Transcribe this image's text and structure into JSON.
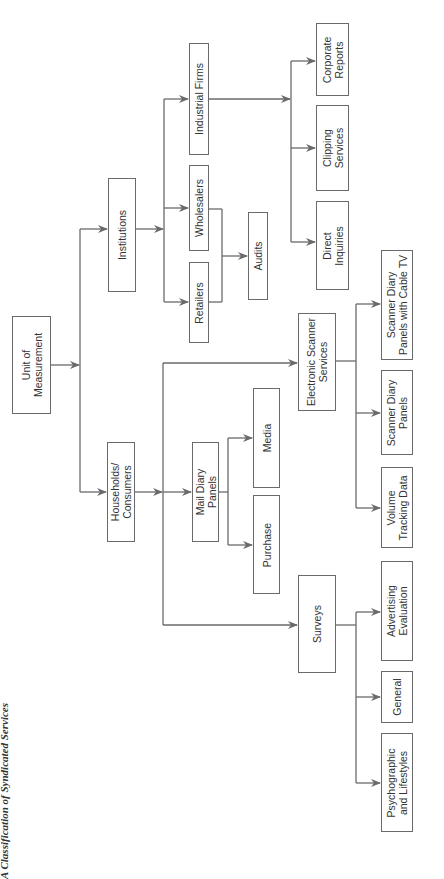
{
  "caption": "A Classification of Syndicated Services",
  "colors": {
    "line": "#6a6a6a",
    "text": "#333333",
    "background": "#ffffff"
  },
  "nodes": {
    "root": "Unit of\nMeasurement",
    "households": "Households/\nConsumers",
    "institutions": "Institutions",
    "retailers": "Retailers",
    "wholesalers": "Wholesalers",
    "industrial": "Industrial Firms",
    "audits": "Audits",
    "direct": "Direct\nInquiries",
    "clipping": "Clipping\nServices",
    "corporate": "Corporate\nReports",
    "mail_diary": "Mail Diary\nPanels",
    "media": "Media",
    "purchase": "Purchase",
    "electronic": "Electronic Scanner\nServices",
    "surveys": "Surveys",
    "volume": "Volume\nTracking Data",
    "scanner_diary": "Scanner Diary\nPanels",
    "scanner_cable": "Scanner Diary\nPanels with Cable TV",
    "advertising": "Advertising\nEvaluation",
    "general": "General",
    "psychographic": "Psychographic\nand Lifestyles"
  }
}
